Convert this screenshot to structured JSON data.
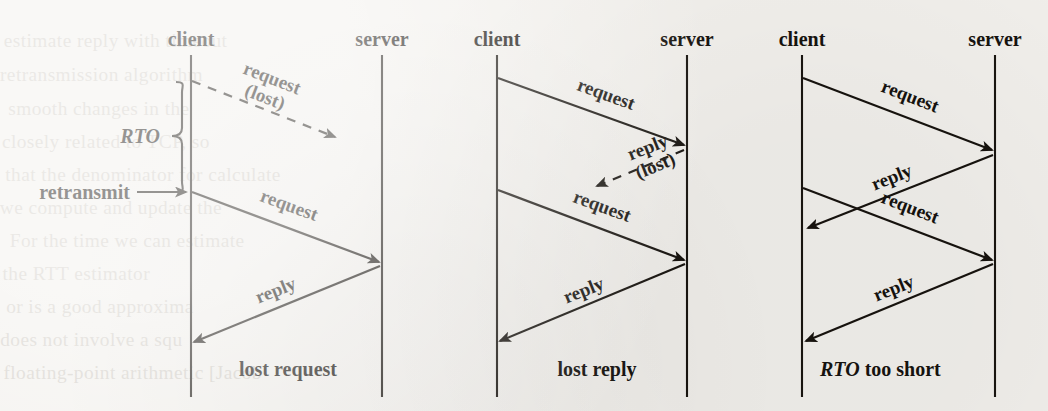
{
  "figure": {
    "kind": "timing-diagram-set",
    "panels": [
      {
        "id": "lost-request",
        "caption": "lost request",
        "client_label": "client",
        "server_label": "server",
        "annotations": {
          "rto": "RTO",
          "retransmit": "retransmit"
        },
        "messages": [
          {
            "label": "request",
            "sublabel": "(lost)",
            "style": "dashed",
            "direction": "client-to-server",
            "delivered": false
          },
          {
            "label": "request",
            "sublabel": "",
            "style": "solid",
            "direction": "client-to-server",
            "delivered": true
          },
          {
            "label": "reply",
            "sublabel": "",
            "style": "solid",
            "direction": "server-to-client",
            "delivered": true
          }
        ]
      },
      {
        "id": "lost-reply",
        "caption": "lost reply",
        "client_label": "client",
        "server_label": "server",
        "annotations": {},
        "messages": [
          {
            "label": "request",
            "sublabel": "",
            "style": "solid",
            "direction": "client-to-server",
            "delivered": true
          },
          {
            "label": "reply",
            "sublabel": "(lost)",
            "style": "dashed",
            "direction": "server-to-client",
            "delivered": false
          },
          {
            "label": "request",
            "sublabel": "",
            "style": "solid",
            "direction": "client-to-server",
            "delivered": true
          },
          {
            "label": "reply",
            "sublabel": "",
            "style": "solid",
            "direction": "server-to-client",
            "delivered": true
          }
        ]
      },
      {
        "id": "rto-too-short",
        "caption_italic": "RTO",
        "caption_rest": " too short",
        "client_label": "client",
        "server_label": "server",
        "annotations": {},
        "messages": [
          {
            "label": "request",
            "sublabel": "",
            "style": "solid",
            "direction": "client-to-server",
            "delivered": true
          },
          {
            "label": "reply",
            "sublabel": "",
            "style": "solid",
            "direction": "server-to-client",
            "delivered": true
          },
          {
            "label": "request",
            "sublabel": "",
            "style": "solid",
            "direction": "client-to-server",
            "delivered": true
          },
          {
            "label": "reply",
            "sublabel": "",
            "style": "solid",
            "direction": "server-to-client",
            "delivered": true
          }
        ]
      }
    ]
  },
  "bleed_through": {
    "note": "faint mirrored text showing through from the reverse page",
    "lines": [
      "estimate reply with timeout",
      "retransmission algorithm",
      "smooth changes in the",
      "closely related to TCP, so",
      "that the denominator for calculate",
      "we compute and update the",
      "For the time we can estimate",
      "the RTT estimator",
      "or is a good approxima",
      "does not involve a squ",
      "floating-point arithmetic [Jacob"
    ]
  },
  "colors": {
    "ink": "#17130e",
    "paper": "#f2f0ec",
    "bleed": "#b9b3aa"
  }
}
